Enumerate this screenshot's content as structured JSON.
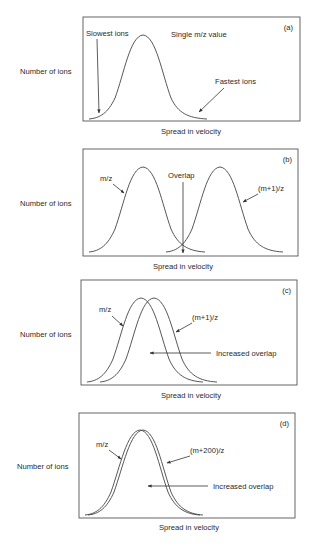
{
  "figure": {
    "y_axis_label": "Number of ions",
    "x_axis_label": "Spread in velocity",
    "panels": [
      {
        "id": "a",
        "tag": "(a)",
        "title": "Single m/z value",
        "annotations": [
          "Slowest ions",
          "Fastest ions"
        ]
      },
      {
        "id": "b",
        "tag": "(b)",
        "series": [
          "m/z",
          "(m+1)/z"
        ],
        "annotations": [
          "Overlap"
        ]
      },
      {
        "id": "c",
        "tag": "(c)",
        "series": [
          "m/z",
          "(m+1)/z"
        ],
        "annotations": [
          "Increased overlap"
        ]
      },
      {
        "id": "d",
        "tag": "(d)",
        "series": [
          "m/z",
          "(m+200)/z"
        ],
        "annotations": [
          "Increased overlap"
        ]
      }
    ]
  },
  "colors": {
    "line": "#444444",
    "text": "#2a2a2a",
    "background": "#ffffff"
  }
}
